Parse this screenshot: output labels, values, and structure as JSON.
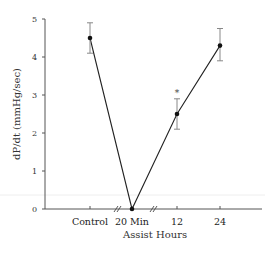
{
  "chart_data": {
    "type": "line",
    "title": "",
    "xlabel": "Assist Hours",
    "ylabel": "dP/dt (mmHg/sec)",
    "ylim": [
      0,
      5
    ],
    "yticks": [
      0,
      1,
      2,
      3,
      4,
      5
    ],
    "grid": false,
    "legend": null,
    "categories": [
      "Control",
      "20 Min",
      "12",
      "24"
    ],
    "series": [
      {
        "name": "dP/dt",
        "values": [
          4.5,
          0.0,
          2.5,
          4.3
        ],
        "error_upper": [
          4.9,
          0.0,
          2.9,
          4.75
        ],
        "error_lower": [
          4.1,
          0.0,
          2.1,
          3.9
        ]
      }
    ],
    "annotations": [
      {
        "category": "12",
        "text": "*",
        "y": 3.1
      }
    ],
    "axis_breaks": [
      "between Control and 20 Min",
      "between 20 Min and 12"
    ]
  },
  "axis": {
    "y_title": "dP/dt (mmHg/sec)",
    "x_title": "Assist Hours",
    "y_tick_labels": [
      "0",
      "1",
      "2",
      "3",
      "4",
      "5"
    ],
    "x_tick_labels": [
      "Control",
      "20 Min",
      "12",
      "24"
    ],
    "significance_marker": "*"
  }
}
